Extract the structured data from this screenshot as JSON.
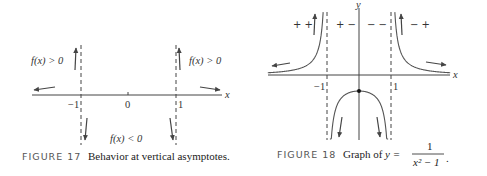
{
  "figure17": {
    "caption_label": "FIGURE 17",
    "caption_text": "Behavior at vertical asymptotes.",
    "labels": {
      "upper_left": "f(x) > 0",
      "upper_right": "f(x) > 0",
      "lower_middle": "f(x) < 0",
      "x_axis": "x",
      "tick_neg1": "−1",
      "tick_0": "0",
      "tick_1": "1"
    }
  },
  "figure18": {
    "caption_label": "FIGURE 18",
    "caption_text": "Graph of",
    "caption_eq_lhs": "y =",
    "caption_numerator": "1",
    "caption_denominator": "x² − 1",
    "caption_period": ".",
    "labels": {
      "x_axis": "x",
      "y_axis": "y",
      "tick_neg1": "−1",
      "tick_1": "1"
    },
    "sign_labels": [
      "+ +",
      "+ −",
      "− −",
      "− +"
    ]
  },
  "chart_data": [
    {
      "type": "line",
      "title": "FIGURE 17 Behavior at vertical asymptotes.",
      "xlabel": "x",
      "ylabel": "",
      "xticks": [
        -1,
        0,
        1
      ],
      "asymptotes_x": [
        -1,
        1
      ],
      "annotations": [
        "f(x) > 0 (left of −1, up)",
        "f(x) > 0 (right of 1, up)",
        "f(x) < 0 (between −1 and 1, down)"
      ],
      "grid": false
    },
    {
      "type": "line",
      "title": "FIGURE 18 Graph of y = 1/(x² − 1).",
      "function": "y = 1/(x^2 - 1)",
      "xlabel": "x",
      "ylabel": "y",
      "xticks": [
        -1,
        1
      ],
      "asymptotes_x": [
        -1,
        1
      ],
      "horizontal_asymptote_y": 0,
      "marked_point": [
        0,
        -1
      ],
      "sign_regions": [
        "+ +",
        "+ −",
        "− −",
        "− +"
      ],
      "grid": false
    }
  ]
}
